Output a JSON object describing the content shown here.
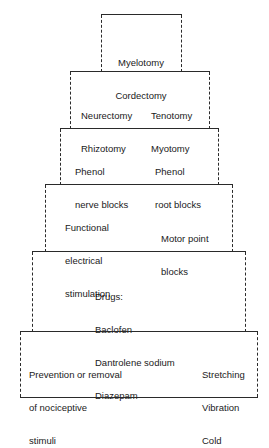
{
  "tiers": [
    {
      "id": "tier-1",
      "left": [
        "Myelotomy",
        "Cordectomy"
      ],
      "right": []
    },
    {
      "id": "tier-2",
      "left": [
        "Neurectomy",
        "Rhizotomy"
      ],
      "right": [
        "Tenotomy",
        "Myotomy"
      ]
    },
    {
      "id": "tier-3",
      "left": [
        "Phenol",
        "nerve blocks"
      ],
      "right": [
        "Phenol",
        "root blocks"
      ]
    },
    {
      "id": "tier-4",
      "left": [
        "Functional",
        "electrical",
        "stimulation"
      ],
      "right": [
        "Motor point",
        "blocks"
      ]
    },
    {
      "id": "tier-5",
      "left": [
        "Drugs:",
        "Baclofen",
        "Dantrolene sodium",
        "Diazepam"
      ],
      "right": []
    },
    {
      "id": "tier-6",
      "left": [
        "Prevention or removal",
        "of nociceptive",
        "stimuli"
      ],
      "right": [
        "Stretching",
        "Vibration",
        "Cold"
      ]
    }
  ]
}
